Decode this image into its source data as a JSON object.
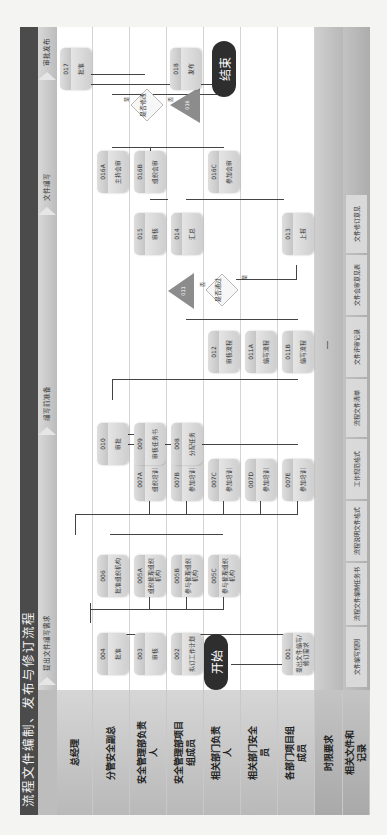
{
  "title": "流程文件编制、发布与修订流程",
  "stages": [
    {
      "label": "提出文件编写需求"
    },
    {
      "label": "编写前准备"
    },
    {
      "label": "文件编写"
    },
    {
      "label": "审批发布"
    }
  ],
  "lanes": [
    {
      "label": "总经理"
    },
    {
      "label": "分管安全副总"
    },
    {
      "label": "安全管理部负责人"
    },
    {
      "label": "安全管理部项目组成员"
    },
    {
      "label": "相关部门负责人"
    },
    {
      "label": "相关部门安全员"
    },
    {
      "label": "各部门项目组成员"
    }
  ],
  "rows": {
    "time_label": "时限要求",
    "time_value": "—",
    "docs_label": "相关文件和记录"
  },
  "records": [
    {
      "label": "文件编写规则"
    },
    {
      "label": "流程文件编制任务书"
    },
    {
      "label": "流程说明文件格式"
    },
    {
      "label": "工作规范格式"
    },
    {
      "label": "流程文件清单"
    },
    {
      "label": "文件评审记录"
    },
    {
      "label": "文件会审意见表"
    },
    {
      "label": "文件修订意见"
    }
  ],
  "terminals": {
    "start": "开始",
    "end": "结束"
  },
  "steps": {
    "s001": {
      "code": "001",
      "text": "提出文件编写/修订需求"
    },
    "s002": {
      "code": "002",
      "text": "拟订工作计划"
    },
    "s003": {
      "code": "003",
      "text": "审核"
    },
    "s004": {
      "code": "004",
      "text": "批准"
    },
    "s005A": {
      "code": "005A",
      "text": "组织梳理组织机构"
    },
    "s005B": {
      "code": "005B",
      "text": "参与梳理组织机构"
    },
    "s005C": {
      "code": "005C",
      "text": "参与梳理组织机构"
    },
    "s006": {
      "code": "006",
      "text": "批准组织机构"
    },
    "s007A": {
      "code": "007A",
      "text": "组织培训"
    },
    "s007B": {
      "code": "007B",
      "text": "参加培训"
    },
    "s007C": {
      "code": "007C",
      "text": "参加培训"
    },
    "s007D": {
      "code": "007D",
      "text": "参加培训"
    },
    "s007E": {
      "code": "007E",
      "text": "参加培训"
    },
    "s008": {
      "code": "008",
      "text": "分配任务"
    },
    "s009": {
      "code": "009",
      "text": "审核任务书"
    },
    "s010": {
      "code": "010",
      "text": "审批"
    },
    "s011A": {
      "code": "011A",
      "text": "编写流程"
    },
    "s011B": {
      "code": "011B",
      "text": "编写流程"
    },
    "s012": {
      "code": "012",
      "text": "审核流程"
    },
    "s013": {
      "code": "013",
      "text": "上报"
    },
    "s014": {
      "code": "014",
      "text": "汇总"
    },
    "s015": {
      "code": "015",
      "text": "审核"
    },
    "s016A": {
      "code": "016A",
      "text": "主持会审"
    },
    "s016B": {
      "code": "016B",
      "text": "组织会审"
    },
    "s016C": {
      "code": "016C",
      "text": "参加会审"
    },
    "s017": {
      "code": "017",
      "text": "批准"
    },
    "s018": {
      "code": "018",
      "text": "发布"
    }
  },
  "decisions": {
    "d1": {
      "text": "是否通过",
      "yes": "是",
      "no": "否"
    },
    "d2": {
      "text": "是否修改",
      "yes": "是",
      "no": "否"
    }
  },
  "connectors": {
    "c1": "011",
    "c2": "016"
  },
  "colors": {
    "title_bg": "#4b4b4b",
    "terminal_bg": "#2e2e2e",
    "connector_fill": "#8c8c8c",
    "box_fill": "#dcdcdc"
  }
}
